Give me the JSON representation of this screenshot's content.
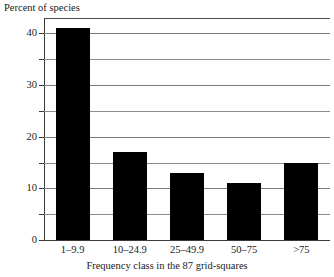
{
  "chart_data": {
    "type": "bar",
    "title": "",
    "subtitle": "",
    "xlabel": "Frequency class in the 87 grid-squares",
    "ylabel": "Percent of species",
    "categories": [
      "1–9.9",
      "10–24.9",
      "25–49.9",
      "50–75",
      ">75"
    ],
    "values": [
      41,
      17,
      13,
      11,
      15
    ],
    "ylim": [
      0,
      43
    ],
    "xlim_note": "categorical",
    "y_major_ticks": [
      0,
      10,
      20,
      30,
      40
    ],
    "y_major_tick_labels": [
      "0",
      "10",
      "20",
      "30",
      "40"
    ],
    "y_minor_ticks": [
      5,
      15,
      25,
      35
    ],
    "gridlines": {
      "horizontal": [
        5,
        10,
        15,
        20,
        25,
        30,
        35,
        40
      ],
      "vertical": []
    },
    "grid": true,
    "legend": null,
    "legend_position": "none",
    "bar_color": "#000000",
    "background_color": "#ffffff",
    "axis_color": "#3a3a3a",
    "gridline_color": "#8c8c8c",
    "annotations": []
  },
  "axes": {
    "y_title": "Percent of species",
    "x_title": "Frequency class in the 87 grid-squares"
  }
}
